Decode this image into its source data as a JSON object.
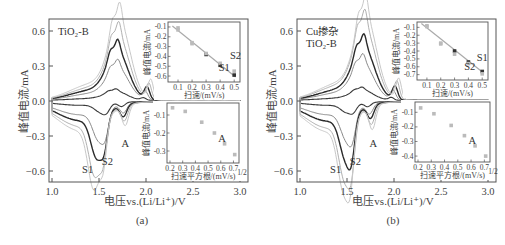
{
  "figure": {
    "panels": [
      {
        "id": "a",
        "caption": "(a)",
        "sample_label_lines": [
          "TiO₂-B"
        ],
        "xlabel": "电压vs.(Li/Li⁺)/V",
        "ylabel": "峰值电流/mA",
        "peak_labels": [
          "S1",
          "S2",
          "A"
        ],
        "inset_top": {
          "xlabel": "扫速/(mV/s)",
          "ylabel": "峰值电流/mA",
          "xticks": [
            "0.1",
            "0.2",
            "0.3",
            "0.4",
            "0.5"
          ],
          "yticks": [
            "-0.1",
            "-0.2",
            "-0.3",
            "-0.4",
            "-0.5",
            "-0.6"
          ],
          "labels": [
            "S1",
            "S2"
          ]
        },
        "inset_bottom": {
          "xlabel": "扫速平方根/(mV/s)",
          "xlabel_sup": "1/2",
          "ylabel": "峰值电流/mA",
          "xticks": [
            "0.2",
            "0.3",
            "0.4",
            "0.5",
            "0.6",
            "0.7"
          ],
          "yticks": [
            "-0.1",
            "-0.2",
            "-0.3"
          ],
          "labels": [
            "A"
          ]
        }
      },
      {
        "id": "b",
        "caption": "(b)",
        "sample_label_lines": [
          "Cu掺杂",
          "TiO₂-B"
        ],
        "xlabel": "电压vs.(Li/Li⁺)/V",
        "ylabel": "峰值电流/mA",
        "peak_labels": [
          "S1",
          "S2",
          "A"
        ],
        "inset_top": {
          "xlabel": "扫速/(mV/s)",
          "ylabel": "峰值电流/mA",
          "xticks": [
            "0.1",
            "0.2",
            "0.3",
            "0.4",
            "0.5"
          ],
          "yticks": [
            "-0.1",
            "-0.2",
            "-0.3",
            "-0.4",
            "-0.5",
            "-0.6",
            "-0.7"
          ],
          "labels": [
            "S1",
            "S2"
          ]
        },
        "inset_bottom": {
          "xlabel": "扫速平方根/(mV/s)",
          "xlabel_sup": "1/2",
          "ylabel": "峰值电流/mA",
          "xticks": [
            "0.2",
            "0.3",
            "0.4",
            "0.5",
            "0.6",
            "0.7"
          ],
          "yticks": [
            "-0.1",
            "-0.2",
            "-0.3",
            "-0.4"
          ],
          "labels": [
            "A"
          ]
        }
      }
    ]
  },
  "chart_data": [
    {
      "type": "line",
      "title": "(a) TiO₂-B cyclic voltammetry at various scan rates",
      "xlabel": "电压vs.(Li/Li⁺)/V",
      "ylabel": "峰值电流/mA",
      "xlim": [
        1.0,
        3.0
      ],
      "ylim": [
        -0.7,
        0.7
      ],
      "xticks": [
        1.0,
        1.5,
        2.0,
        2.5,
        3.0
      ],
      "yticks": [
        -0.6,
        -0.3,
        0.0,
        0.3,
        0.6
      ],
      "grid": false,
      "scan_rates_mV_s": [
        0.1,
        0.2,
        0.3,
        0.4,
        0.5
      ],
      "series_peaks": [
        {
          "name": "0.1 mV/s",
          "anodic_peak": [
            1.68,
            0.07
          ],
          "cathodic_S1": [
            1.52,
            -0.07
          ],
          "cathodic_S2": [
            1.58,
            -0.08
          ],
          "cathodic_A": [
            1.74,
            -0.06
          ]
        },
        {
          "name": "0.2 mV/s",
          "anodic_peak": [
            1.7,
            0.25
          ],
          "cathodic_S1": [
            1.5,
            -0.25
          ],
          "cathodic_S2": [
            1.57,
            -0.24
          ],
          "cathodic_A": [
            1.76,
            -0.13
          ]
        },
        {
          "name": "0.3 mV/s",
          "anodic_peak": [
            1.7,
            0.37
          ],
          "cathodic_S1": [
            1.48,
            -0.36
          ],
          "cathodic_S2": [
            1.56,
            -0.34
          ],
          "cathodic_A": [
            1.76,
            -0.17
          ]
        },
        {
          "name": "0.4 mV/s",
          "anodic_peak": [
            1.71,
            0.48
          ],
          "cathodic_S1": [
            1.46,
            -0.47
          ],
          "cathodic_S2": [
            1.55,
            -0.45
          ],
          "cathodic_A": [
            1.77,
            -0.22
          ]
        },
        {
          "name": "0.5 mV/s",
          "anodic_peak": [
            1.72,
            0.6
          ],
          "cathodic_S1": [
            1.45,
            -0.55
          ],
          "cathodic_S2": [
            1.55,
            -0.52
          ],
          "cathodic_A": [
            1.78,
            -0.28
          ]
        }
      ],
      "annotations": [
        "TiO₂-B",
        "S1",
        "S2",
        "A"
      ],
      "insets": [
        {
          "type": "scatter",
          "xlabel": "扫速/(mV/s)",
          "ylabel": "峰值电流/mA",
          "xlim": [
            0.05,
            0.52
          ],
          "ylim": [
            -0.63,
            -0.08
          ],
          "series": [
            {
              "name": "S1",
              "x": [
                0.1,
                0.2,
                0.3,
                0.4,
                0.5
              ],
              "y": [
                -0.13,
                -0.27,
                -0.38,
                -0.49,
                -0.59
              ]
            },
            {
              "name": "S2",
              "x": [
                0.1,
                0.2,
                0.3,
                0.4,
                0.5
              ],
              "y": [
                -0.11,
                -0.26,
                -0.37,
                -0.47,
                -0.55
              ]
            }
          ],
          "fit_line": true
        },
        {
          "type": "scatter",
          "xlabel": "扫速平方根/(mV/s)^1/2",
          "ylabel": "峰值电流/mA",
          "xlim": [
            0.2,
            0.72
          ],
          "ylim": [
            -0.35,
            -0.05
          ],
          "series": [
            {
              "name": "A",
              "x": [
                0.22,
                0.32,
                0.45,
                0.55,
                0.63,
                0.71
              ],
              "y": [
                -0.06,
                -0.08,
                -0.14,
                -0.2,
                -0.26,
                -0.32
              ]
            }
          ]
        }
      ]
    },
    {
      "type": "line",
      "title": "(b) Cu掺杂 TiO₂-B cyclic voltammetry at various scan rates",
      "xlabel": "电压vs.(Li/Li⁺)/V",
      "ylabel": "峰值电流/mA",
      "xlim": [
        1.0,
        3.0
      ],
      "ylim": [
        -0.7,
        0.7
      ],
      "xticks": [
        1.0,
        1.5,
        2.0,
        2.5,
        3.0
      ],
      "yticks": [
        -0.6,
        -0.3,
        0.0,
        0.3,
        0.6
      ],
      "grid": false,
      "scan_rates_mV_s": [
        0.1,
        0.2,
        0.3,
        0.4,
        0.5
      ],
      "series_peaks": [
        {
          "name": "0.1 mV/s",
          "anodic_peak": [
            1.66,
            0.08
          ],
          "cathodic_S1": [
            1.5,
            -0.07
          ],
          "cathodic_S2": [
            1.57,
            -0.08
          ],
          "cathodic_A": [
            1.72,
            -0.06
          ]
        },
        {
          "name": "0.2 mV/s",
          "anodic_peak": [
            1.67,
            0.28
          ],
          "cathodic_S1": [
            1.5,
            -0.25
          ],
          "cathodic_S2": [
            1.56,
            -0.24
          ],
          "cathodic_A": [
            1.74,
            -0.14
          ]
        },
        {
          "name": "0.3 mV/s",
          "anodic_peak": [
            1.68,
            0.4
          ],
          "cathodic_S1": [
            1.49,
            -0.37
          ],
          "cathodic_S2": [
            1.55,
            -0.37
          ],
          "cathodic_A": [
            1.75,
            -0.19
          ]
        },
        {
          "name": "0.4 mV/s",
          "anodic_peak": [
            1.69,
            0.55
          ],
          "cathodic_S1": [
            1.48,
            -0.5
          ],
          "cathodic_S2": [
            1.55,
            -0.49
          ],
          "cathodic_A": [
            1.76,
            -0.26
          ]
        },
        {
          "name": "0.5 mV/s",
          "anodic_peak": [
            1.7,
            0.64
          ],
          "cathodic_S1": [
            1.47,
            -0.57
          ],
          "cathodic_S2": [
            1.54,
            -0.58
          ],
          "cathodic_A": [
            1.77,
            -0.33
          ]
        }
      ],
      "annotations": [
        "Cu掺杂",
        "TiO₂-B",
        "S1",
        "S2",
        "A"
      ],
      "insets": [
        {
          "type": "scatter",
          "xlabel": "扫速/(mV/s)",
          "ylabel": "峰值电流/mA",
          "xlim": [
            0.05,
            0.52
          ],
          "ylim": [
            -0.73,
            -0.07
          ],
          "series": [
            {
              "name": "S1",
              "x": [
                0.1,
                0.2,
                0.3,
                0.4,
                0.5
              ],
              "y": [
                -0.09,
                -0.3,
                -0.4,
                -0.54,
                -0.66
              ]
            },
            {
              "name": "S2",
              "x": [
                0.1,
                0.2,
                0.3,
                0.4,
                0.5
              ],
              "y": [
                -0.08,
                -0.31,
                -0.44,
                -0.56,
                -0.69
              ]
            }
          ],
          "fit_line": true
        },
        {
          "type": "scatter",
          "xlabel": "扫速平方根/(mV/s)^1/2",
          "ylabel": "峰值电流/mA",
          "xlim": [
            0.2,
            0.72
          ],
          "ylim": [
            -0.42,
            -0.05
          ],
          "series": [
            {
              "name": "A",
              "x": [
                0.22,
                0.32,
                0.45,
                0.55,
                0.63,
                0.71
              ],
              "y": [
                -0.07,
                -0.11,
                -0.19,
                -0.26,
                -0.33,
                -0.4
              ]
            }
          ]
        }
      ]
    }
  ]
}
